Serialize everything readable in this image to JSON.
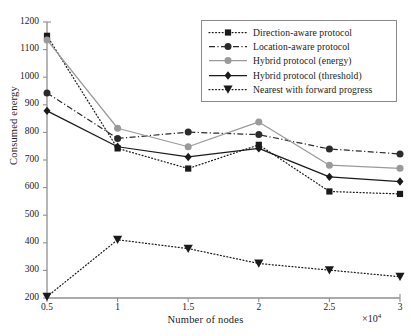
{
  "chart_data": {
    "type": "line",
    "title": "",
    "xlabel": "Number of nodes",
    "ylabel": "Consumed energy",
    "x_multiplier": "×10",
    "x_multiplier_exponent": "4",
    "x": [
      0.5,
      1,
      1.5,
      2,
      2.5,
      3
    ],
    "xtick_labels": [
      "0.5",
      "1",
      "1.5",
      "2",
      "2.5",
      "3"
    ],
    "ytick_labels": [
      "200",
      "300",
      "400",
      "500",
      "600",
      "700",
      "800",
      "900",
      "1000",
      "1100",
      "1200"
    ],
    "xlim": [
      0.5,
      3
    ],
    "ylim": [
      200,
      1200
    ],
    "grid": false,
    "legend_position": "top-right",
    "series": [
      {
        "name": "Direction-aware protocol",
        "values": [
          1150,
          742,
          669,
          755,
          586,
          577
        ],
        "color": "#1a1a1a",
        "line_style": "dotted",
        "marker": "square"
      },
      {
        "name": "Location-aware protocol",
        "values": [
          943,
          778,
          801,
          792,
          740,
          722
        ],
        "color": "#2b2b2b",
        "line_style": "dash-dot",
        "marker": "circle"
      },
      {
        "name": "Hybrid protocol (energy)",
        "values": [
          1135,
          815,
          748,
          838,
          681,
          670
        ],
        "color": "#9a9a9a",
        "line_style": "solid",
        "marker": "circle"
      },
      {
        "name": "Hybrid protocol (threshold)",
        "values": [
          878,
          748,
          711,
          742,
          639,
          622
        ],
        "color": "#1a1a1a",
        "line_style": "solid",
        "marker": "diamond"
      },
      {
        "name": "Nearest with forward progress",
        "values": [
          205,
          411,
          379,
          325,
          301,
          277
        ],
        "color": "#1a1a1a",
        "line_style": "dotted",
        "marker": "triangle-down"
      }
    ]
  }
}
